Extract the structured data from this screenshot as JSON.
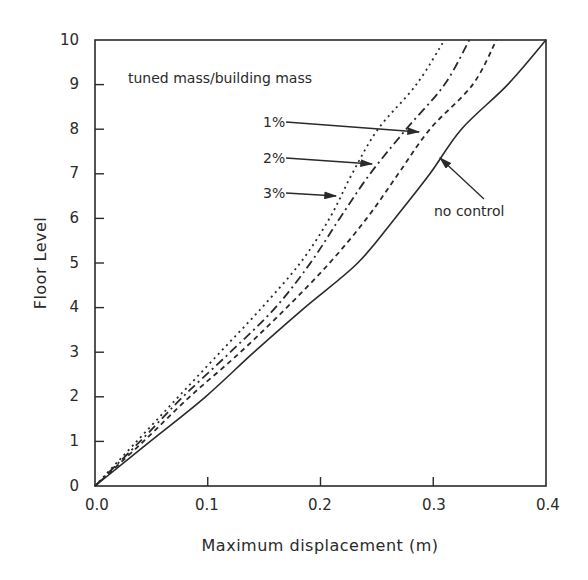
{
  "chart_data": {
    "type": "line",
    "title": "",
    "xlabel": "Maximum displacement (m)",
    "ylabel": "Floor Level",
    "xlim": [
      0.0,
      0.4
    ],
    "ylim": [
      0,
      10
    ],
    "xticks": [
      "0.0",
      "0.1",
      "0.2",
      "0.3",
      "0.4"
    ],
    "yticks": [
      "0",
      "1",
      "2",
      "3",
      "4",
      "5",
      "6",
      "7",
      "8",
      "9",
      "10"
    ],
    "grid": false,
    "legend": {
      "title": "tuned mass/building mass",
      "position": "inline-annotations"
    },
    "y": [
      0,
      1,
      2,
      3,
      4,
      5,
      6,
      7,
      8,
      9,
      10
    ],
    "series": [
      {
        "name": "no control",
        "style": "solid",
        "x": [
          0.0,
          0.049,
          0.098,
          0.141,
          0.186,
          0.233,
          0.266,
          0.297,
          0.325,
          0.366,
          0.4
        ]
      },
      {
        "name": "1%",
        "style": "dashed",
        "x": [
          0.0,
          0.043,
          0.084,
          0.129,
          0.17,
          0.208,
          0.241,
          0.269,
          0.297,
          0.335,
          0.356
        ]
      },
      {
        "name": "2%",
        "style": "dash-dot",
        "x": [
          0.0,
          0.04,
          0.078,
          0.12,
          0.16,
          0.191,
          0.217,
          0.244,
          0.276,
          0.31,
          0.332
        ]
      },
      {
        "name": "3%",
        "style": "dotted",
        "x": [
          0.0,
          0.037,
          0.074,
          0.111,
          0.148,
          0.182,
          0.208,
          0.228,
          0.251,
          0.285,
          0.31
        ]
      }
    ],
    "annotations": [
      {
        "text": "tuned mass/building mass"
      },
      {
        "text": "1%",
        "points_to": "1%"
      },
      {
        "text": "2%",
        "points_to": "2%"
      },
      {
        "text": "3%",
        "points_to": "3%"
      },
      {
        "text": "no control",
        "points_to": "no control"
      }
    ]
  },
  "labels": {
    "xlabel": "Maximum displacement (m)",
    "ylabel": "Floor Level",
    "legend_title": "tuned mass/building mass",
    "l1": "1%",
    "l2": "2%",
    "l3": "3%",
    "nc": "no control",
    "xt0": "0.0",
    "xt1": "0.1",
    "xt2": "0.2",
    "xt3": "0.3",
    "xt4": "0.4",
    "yt0": "0",
    "yt1": "1",
    "yt2": "2",
    "yt3": "3",
    "yt4": "4",
    "yt5": "5",
    "yt6": "6",
    "yt7": "7",
    "yt8": "8",
    "yt9": "9",
    "yt10": "10"
  },
  "colors": {
    "ink": "#2a2a2a",
    "background": "#ffffff"
  }
}
